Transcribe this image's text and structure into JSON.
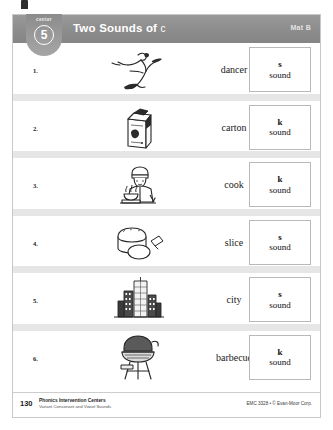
{
  "header": {
    "badge_label": "center",
    "badge_number": "5",
    "title": "Two Sounds of",
    "title_letter": "c",
    "mat_label": "Mat B",
    "bar_color": "#8e8e8e"
  },
  "rows": [
    {
      "number": "1.",
      "icon": "ballet-dancer-icon",
      "word": "dancer",
      "answer_letter": "s",
      "answer_word": "sound"
    },
    {
      "number": "2.",
      "icon": "milk-carton-icon",
      "word": "carton",
      "answer_letter": "k",
      "answer_word": "sound"
    },
    {
      "number": "3.",
      "icon": "chef-cook-icon",
      "word": "cook",
      "answer_letter": "k",
      "answer_word": "sound"
    },
    {
      "number": "4.",
      "icon": "bread-slice-icon",
      "word": "slice",
      "answer_letter": "s",
      "answer_word": "sound"
    },
    {
      "number": "5.",
      "icon": "city-buildings-icon",
      "word": "city",
      "answer_letter": "s",
      "answer_word": "sound"
    },
    {
      "number": "6.",
      "icon": "barbecue-grill-icon",
      "word": "barbecue",
      "answer_letter": "k",
      "answer_word": "sound"
    }
  ],
  "footer": {
    "page_number": "130",
    "title": "Phonics Intervention Centers",
    "subtitle": "Variant Consonant and Vowel Sounds",
    "credit": "EMC 3328 • © Evan-Moor Corp."
  }
}
